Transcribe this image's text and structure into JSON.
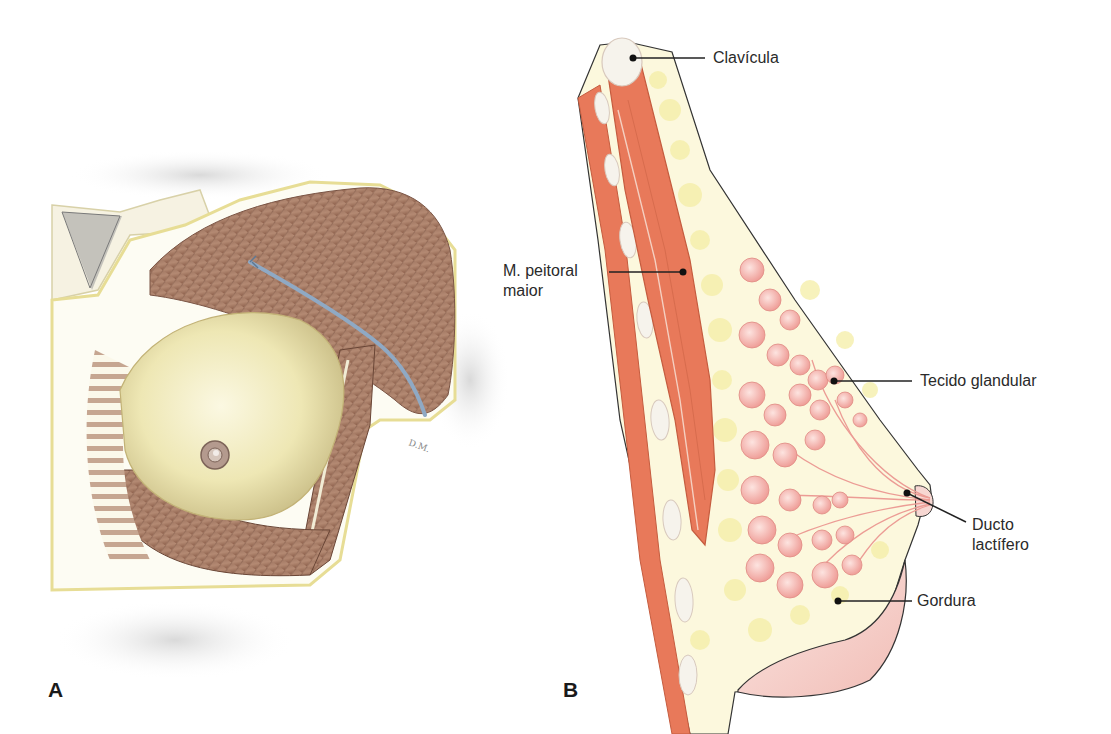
{
  "figure": {
    "panels": [
      {
        "id": "A",
        "letter": "A",
        "description": "Colored-pencil anatomical illustration of the female chest showing the breast overlying the pectoralis major muscle, with a blue vessel crossing toward the axilla"
      },
      {
        "id": "B",
        "letter": "B",
        "description": "Sagittal cross-section of the breast showing clavicle, pectoralis major muscle, glandular lobules, lactiferous ducts and fat",
        "labels": [
          {
            "key": "clavicula",
            "text": "Clavícula"
          },
          {
            "key": "peitoral",
            "text": "M. peitoral maior",
            "lines": [
              "M. peitoral",
              "maior"
            ]
          },
          {
            "key": "glandular",
            "text": "Tecido glandular"
          },
          {
            "key": "ducto",
            "text": "Ducto lactífero",
            "lines": [
              "Ducto",
              "lactífero"
            ]
          },
          {
            "key": "gordura",
            "text": "Gordura"
          }
        ]
      }
    ],
    "colors": {
      "muscle": "#e8795a",
      "muscle_dark": "#d9613f",
      "gland": "#f4b8b4",
      "fat": "#f8f3c4",
      "skin_pink": "#f6d3cf",
      "bone": "#f6f3ec",
      "leader_line": "#222222",
      "drawing_muscle_brown": "#a8775f",
      "drawing_skin": "#f1ecc0",
      "vessel_blue": "#8fa9c4"
    }
  }
}
